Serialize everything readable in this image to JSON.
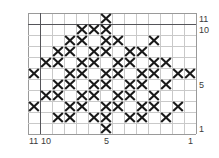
{
  "chart_data": {
    "type": "heatmap",
    "title": "",
    "xlabel": "",
    "ylabel": "",
    "columns": 14,
    "rows": 11,
    "cell_symbol": "X",
    "grid": true,
    "x_numbering_direction": "right-to-left",
    "y_numbering_direction": "bottom-to-top",
    "xlim": [
      1,
      14
    ],
    "ylim": [
      1,
      11
    ],
    "x_tick_labels": [
      "11",
      "10",
      "5",
      "1"
    ],
    "y_tick_labels": [
      "11",
      "10",
      "5",
      "1"
    ],
    "grid_line_color": "#c9c9c9",
    "emphasis_line_color": "#55555a",
    "symbol_color": "#1a1a1a",
    "background_color": "#ffffff",
    "emphasis_column_index": 1,
    "emphasis_row_index": 1,
    "marked_cells": [
      [
        0,
        6
      ],
      [
        1,
        4
      ],
      [
        1,
        5
      ],
      [
        1,
        6
      ],
      [
        2,
        3
      ],
      [
        2,
        4
      ],
      [
        2,
        6
      ],
      [
        2,
        7
      ],
      [
        2,
        10
      ],
      [
        3,
        2
      ],
      [
        3,
        3
      ],
      [
        3,
        5
      ],
      [
        3,
        6
      ],
      [
        3,
        8
      ],
      [
        3,
        9
      ],
      [
        4,
        1
      ],
      [
        4,
        2
      ],
      [
        4,
        4
      ],
      [
        4,
        5
      ],
      [
        4,
        7
      ],
      [
        4,
        8
      ],
      [
        4,
        10
      ],
      [
        4,
        11
      ],
      [
        5,
        0
      ],
      [
        5,
        3
      ],
      [
        5,
        4
      ],
      [
        5,
        6
      ],
      [
        5,
        7
      ],
      [
        5,
        9
      ],
      [
        5,
        10
      ],
      [
        5,
        12
      ],
      [
        5,
        13
      ],
      [
        6,
        2
      ],
      [
        6,
        3
      ],
      [
        6,
        5
      ],
      [
        6,
        6
      ],
      [
        6,
        8
      ],
      [
        6,
        9
      ],
      [
        6,
        11
      ],
      [
        7,
        1
      ],
      [
        7,
        2
      ],
      [
        7,
        4
      ],
      [
        7,
        5
      ],
      [
        7,
        7
      ],
      [
        7,
        8
      ],
      [
        7,
        10
      ],
      [
        8,
        0
      ],
      [
        8,
        3
      ],
      [
        8,
        4
      ],
      [
        8,
        6
      ],
      [
        8,
        7
      ],
      [
        8,
        9
      ],
      [
        8,
        10
      ],
      [
        8,
        12
      ],
      [
        9,
        2
      ],
      [
        9,
        3
      ],
      [
        9,
        5
      ],
      [
        9,
        6
      ],
      [
        9,
        8
      ],
      [
        9,
        9
      ],
      [
        9,
        11
      ],
      [
        10,
        6
      ]
    ],
    "row_marks": [
      {
        "row_label": "11",
        "cells_from_left": [
          6
        ]
      },
      {
        "row_label": "10",
        "cells_from_left": [
          4,
          5,
          6
        ]
      },
      {
        "row_label": "9",
        "cells_from_left": [
          3,
          4,
          6,
          7,
          10
        ]
      },
      {
        "row_label": "8",
        "cells_from_left": [
          2,
          3,
          5,
          6,
          8,
          9
        ]
      },
      {
        "row_label": "7",
        "cells_from_left": [
          1,
          2,
          4,
          5,
          7,
          8,
          10,
          11
        ]
      },
      {
        "row_label": "6",
        "cells_from_left": [
          0,
          3,
          4,
          6,
          7,
          9,
          10,
          12,
          13
        ]
      },
      {
        "row_label": "5",
        "cells_from_left": [
          2,
          3,
          5,
          6,
          8,
          9,
          11
        ]
      },
      {
        "row_label": "4",
        "cells_from_left": [
          1,
          2,
          4,
          5,
          7,
          8,
          10
        ]
      },
      {
        "row_label": "3",
        "cells_from_left": [
          0,
          3,
          4,
          6,
          7,
          9,
          10,
          12
        ]
      },
      {
        "row_label": "2",
        "cells_from_left": [
          2,
          3,
          5,
          6,
          8,
          9,
          11
        ]
      },
      {
        "row_label": "1",
        "cells_from_left": [
          6
        ]
      }
    ]
  },
  "axis": {
    "right_labels": [
      {
        "text": "11",
        "row_index": 0
      },
      {
        "text": "10",
        "row_index": 1
      },
      {
        "text": "5",
        "row_index": 6
      },
      {
        "text": "1",
        "row_index": 10
      }
    ],
    "bottom_labels": [
      {
        "text": "11",
        "col_index": 0
      },
      {
        "text": "10",
        "col_index": 1
      },
      {
        "text": "5",
        "col_index": 6
      },
      {
        "text": "1",
        "col_index": 13
      }
    ]
  }
}
